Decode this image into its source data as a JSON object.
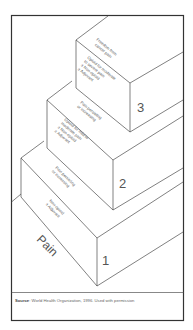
{
  "diagram": {
    "steps": [
      {
        "number": "1",
        "side_text": [
          "Non-opioid",
          "± Adjuvant"
        ],
        "base_label": "Pain"
      },
      {
        "number": "2",
        "top_text": [
          "Pain persisting",
          "or increasing"
        ],
        "side_text": [
          "Opioid for mild to",
          "moderate pain",
          "± Non-opioid",
          "± Adjuvant"
        ]
      },
      {
        "number": "3",
        "top_text": [
          "Pain persisting",
          "or increasing"
        ],
        "side_text": [
          "Opioid for moderate",
          "to severe pain",
          "± Non-opioid",
          "± Adjuvant"
        ],
        "summit_text": [
          "Freedom from",
          "cancer pain"
        ]
      }
    ],
    "source_label": "Source",
    "source_text": ": World Health Organization, 1996. Used with permission"
  },
  "colors": {
    "line": "#4a4a4a",
    "frame": "#333333",
    "text": "#555555",
    "background": "#ffffff"
  }
}
